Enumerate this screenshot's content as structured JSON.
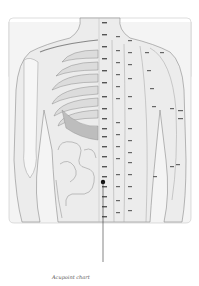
{
  "figure": {
    "caption": "Acupoint chart",
    "marker_color": "#111111",
    "outline_color": "#9a9a9a",
    "frame_color": "#c8c8c8"
  },
  "labels": {
    "midline": [
      "天突",
      "璇玑",
      "华盖",
      "紫宫",
      "玉堂",
      "膻中",
      "中庭",
      "鸠尾",
      "巨阙",
      "上脘",
      "中脘",
      "建里",
      "下脘",
      "水分",
      "神阙",
      "阴交",
      "气海",
      "石门",
      "关元"
    ],
    "kidney": [
      "俞府",
      "彧中",
      "神藏",
      "灵墟",
      "神封",
      "步廊",
      "幽门",
      "腹通谷",
      "阴都",
      "石关",
      "商曲",
      "肓俞",
      "中注",
      "四满",
      "气穴"
    ],
    "stomach": [
      "气户",
      "库房",
      "屋翳",
      "膺窗",
      "乳中",
      "乳根",
      "不容",
      "承满",
      "梁门",
      "关门",
      "太乙",
      "滑肉门",
      "天枢",
      "外陵",
      "大巨"
    ],
    "spleen": [
      "周荣",
      "胸乡",
      "天溪",
      "食窦",
      "腹哀",
      "大横",
      "腹结"
    ]
  }
}
